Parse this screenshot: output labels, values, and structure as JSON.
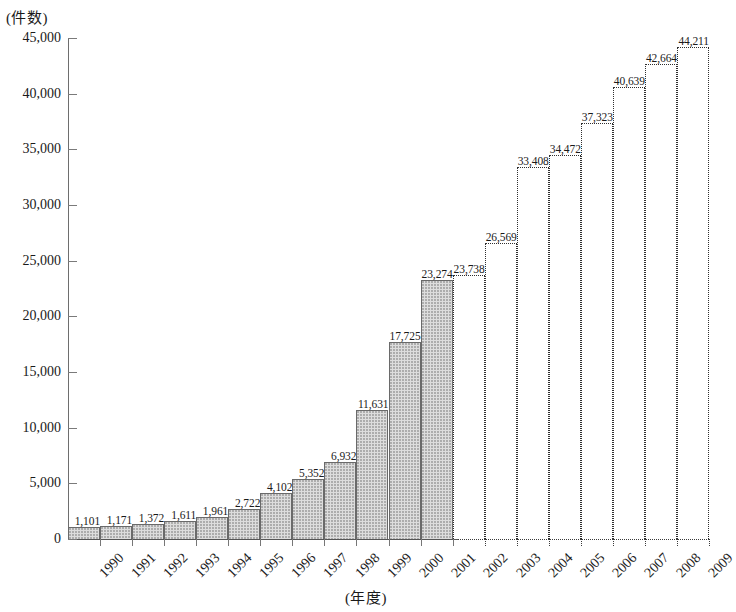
{
  "chart_data": {
    "type": "bar",
    "title": "",
    "subtitle": "",
    "xlabel": "(年度)",
    "ylabel": "(件数)",
    "ylim": [
      0,
      45000
    ],
    "yticks": [
      "0",
      "5,000",
      "10,000",
      "15,000",
      "20,000",
      "25,000",
      "30,000",
      "35,000",
      "40,000",
      "45,000"
    ],
    "ytick_values": [
      0,
      5000,
      10000,
      15000,
      20000,
      25000,
      30000,
      35000,
      40000,
      45000
    ],
    "grid": false,
    "legend": null,
    "categories": [
      "1990",
      "1991",
      "1992",
      "1993",
      "1994",
      "1995",
      "1996",
      "1997",
      "1998",
      "1999",
      "2000",
      "2001",
      "2002",
      "2003",
      "2004",
      "2005",
      "2006",
      "2007",
      "2008",
      "2009"
    ],
    "values": [
      1101,
      1171,
      1372,
      1611,
      1961,
      2722,
      4102,
      5352,
      6932,
      11631,
      17725,
      23274,
      23738,
      26569,
      33408,
      34472,
      37323,
      40639,
      42664,
      44211
    ],
    "labels": [
      "1,101",
      "1,171",
      "1,372",
      "1,611",
      "1,961",
      "2,722",
      "4,102",
      "5,352",
      "6,932",
      "11,631",
      "17,725",
      "23,274",
      "23,738",
      "26,569",
      "33,408",
      "34,472",
      "37,323",
      "40,639",
      "42,664",
      "44,211"
    ],
    "styles": [
      "solid",
      "solid",
      "solid",
      "solid",
      "solid",
      "solid",
      "solid",
      "solid",
      "solid",
      "solid",
      "solid",
      "solid",
      "dashed",
      "dashed",
      "dashed",
      "dashed",
      "dashed",
      "dashed",
      "dashed",
      "dashed"
    ],
    "annotations": {
      "solid_meaning": "actual (shaded bars)",
      "dashed_meaning": "projected (dotted outline bars)"
    },
    "colors": {
      "bar_fill": "#dddddd",
      "bar_border": "#6a6a6a",
      "projected_border": "#2f2f2f",
      "axis": "#6e6e6e",
      "text": "#1a1a1a"
    }
  }
}
